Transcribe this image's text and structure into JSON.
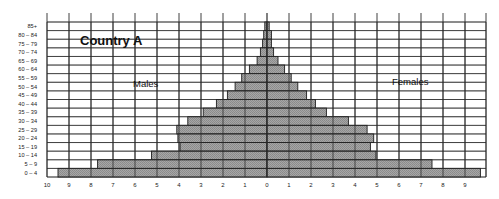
{
  "chart_data": {
    "type": "bar",
    "subtype": "population-pyramid",
    "title": "Country A",
    "xlabel": "",
    "ylabel": "",
    "series_labels": {
      "left": "Males",
      "right": "Females"
    },
    "categories": [
      "85+",
      "80 – 84",
      "75 – 79",
      "70 – 74",
      "65 – 69",
      "60 – 64",
      "55 – 59",
      "50 – 54",
      "45 – 49",
      "40 – 44",
      "35 – 39",
      "30 – 34",
      "25 – 29",
      "20 – 24",
      "15 – 19",
      "10 – 14",
      "5 – 9",
      "0 – 4"
    ],
    "series": [
      {
        "name": "Males",
        "values": [
          0.1,
          0.15,
          0.2,
          0.3,
          0.45,
          0.8,
          1.15,
          1.45,
          1.8,
          2.3,
          2.9,
          3.6,
          4.1,
          4.05,
          3.95,
          5.25,
          7.7,
          9.5
        ]
      },
      {
        "name": "Females",
        "values": [
          0.1,
          0.2,
          0.2,
          0.3,
          0.5,
          0.8,
          1.1,
          1.4,
          1.8,
          2.2,
          2.7,
          3.7,
          4.55,
          4.85,
          4.7,
          4.95,
          7.5,
          9.7
        ]
      }
    ],
    "x_ticks_left": [
      "10",
      "9",
      "8",
      "7",
      "6",
      "5",
      "4",
      "3",
      "2",
      "1",
      "0"
    ],
    "x_ticks_right": [
      "1",
      "2",
      "3",
      "4",
      "5",
      "6",
      "7",
      "8",
      "9"
    ],
    "xlim": [
      -10,
      10
    ],
    "grid": true,
    "colors": {
      "bar_fill": "#9c9c9c",
      "bar_edge": "#1e1e1e",
      "grid": "#2a2a2a",
      "text": "#111111"
    }
  }
}
